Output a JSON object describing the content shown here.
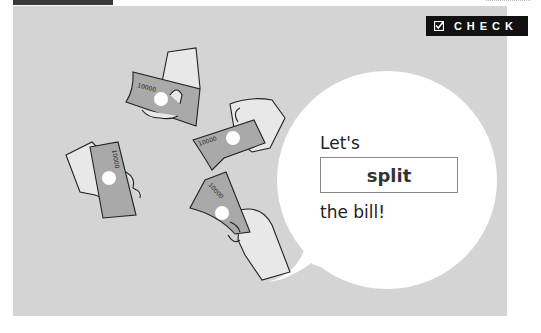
{
  "badge": {
    "label": "CHECK",
    "icon": "checkbox-icon",
    "background": "#111111",
    "color": "#ffffff"
  },
  "speech_bubble": {
    "line1": "Let's",
    "highlight": "split",
    "line2": "the bill!"
  },
  "illustration": {
    "description": "Four hands each holding a banknote",
    "banknote_label": "10000",
    "panel_color": "#d4d4d4",
    "banknote_color": "#a9a9a9",
    "hand_color": "#e8e8e8"
  }
}
